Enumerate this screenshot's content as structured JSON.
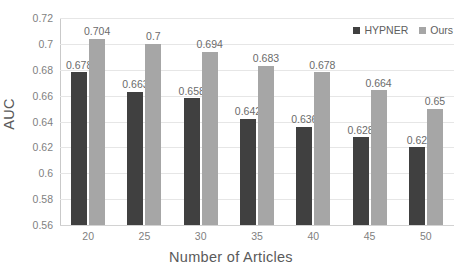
{
  "chart_data": {
    "type": "bar",
    "title": "",
    "xlabel": "Number of Articles",
    "ylabel": "AUC",
    "categories": [
      "20",
      "25",
      "30",
      "35",
      "40",
      "45",
      "50"
    ],
    "series": [
      {
        "name": "HYPNER",
        "color": "#404040",
        "values": [
          0.678,
          0.663,
          0.658,
          0.642,
          0.636,
          0.628,
          0.62
        ],
        "labels": [
          "0.678",
          "0.663",
          "0.658",
          "0.642",
          "0.636",
          "0.628",
          "0.62"
        ]
      },
      {
        "name": "Ours",
        "color": "#a6a6a6",
        "values": [
          0.704,
          0.7,
          0.694,
          0.683,
          0.678,
          0.664,
          0.65
        ],
        "labels": [
          "0.704",
          "0.7",
          "0.694",
          "0.683",
          "0.678",
          "0.664",
          "0.65"
        ]
      }
    ],
    "ylim": [
      0.56,
      0.72
    ],
    "yticks": [
      0.56,
      0.58,
      0.6,
      0.62,
      0.64,
      0.66,
      0.68,
      0.7,
      0.72
    ],
    "ytick_labels": [
      "0.56",
      "0.58",
      "0.6",
      "0.62",
      "0.64",
      "0.66",
      "0.68",
      "0.7",
      "0.72"
    ],
    "grid": true,
    "grid_axis": "y",
    "legend_position": "top-right",
    "data_labels": true,
    "background": "#ffffff",
    "grid_color": "#e6e6e6",
    "axis_color": "#c9c9c9",
    "text_color": "#7f7f7f"
  },
  "legend": {
    "entries": [
      {
        "label": "HYPNER",
        "color": "#404040"
      },
      {
        "label": "Ours",
        "color": "#a6a6a6"
      }
    ]
  },
  "axes": {
    "y_title": "AUC",
    "x_title": "Number of Articles"
  }
}
